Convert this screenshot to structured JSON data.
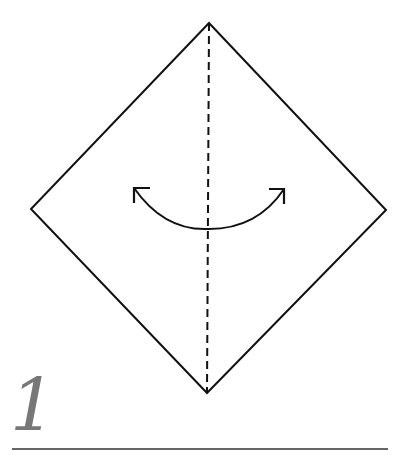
{
  "diagram": {
    "type": "origami-fold-step",
    "step": {
      "number": "1"
    },
    "colors": {
      "paper_outline": "#111111",
      "fold_line": "#111111",
      "arrow": "#111111",
      "step_number": "#777777",
      "underline": "#666666",
      "background": "#ffffff"
    },
    "shapes": {
      "square_paper": {
        "points": [
          [
            209,
            23
          ],
          [
            386,
            210
          ],
          [
            207,
            393
          ],
          [
            31,
            209
          ]
        ]
      },
      "valley_fold_line": {
        "from": [
          209,
          23
        ],
        "to": [
          207,
          393
        ],
        "style": "dashed"
      },
      "fold_and_unfold_arrow": {
        "from": [
          134,
          188
        ],
        "to": [
          284,
          189
        ],
        "lowest_point": [
          209,
          229
        ],
        "heads": "both"
      }
    }
  }
}
